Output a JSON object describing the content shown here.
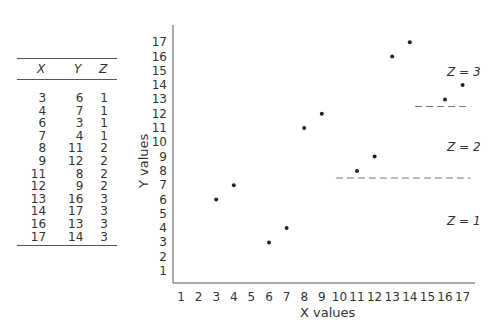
{
  "table": {
    "headers": [
      "X",
      "Y",
      "Z"
    ],
    "rows": [
      [
        "3",
        "6",
        "1"
      ],
      [
        "4",
        "7",
        "1"
      ],
      [
        "6",
        "3",
        "1"
      ],
      [
        "7",
        "4",
        "1"
      ],
      [
        "8",
        "11",
        "2"
      ],
      [
        "9",
        "12",
        "2"
      ],
      [
        "11",
        "8",
        "2"
      ],
      [
        "12",
        "9",
        "2"
      ],
      [
        "13",
        "16",
        "3"
      ],
      [
        "14",
        "17",
        "3"
      ],
      [
        "16",
        "13",
        "3"
      ],
      [
        "17",
        "14",
        "3"
      ]
    ]
  },
  "chart_data": {
    "type": "scatter",
    "title": "",
    "xlabel": "X values",
    "ylabel": "Y values",
    "xlim": [
      1,
      17
    ],
    "ylim": [
      1,
      17
    ],
    "x_ticks": [
      "1",
      "2",
      "3",
      "4",
      "5",
      "6",
      "7",
      "8",
      "9",
      "10",
      "11",
      "12",
      "13",
      "14",
      "15",
      "16",
      "17"
    ],
    "y_ticks": [
      "1",
      "2",
      "3",
      "4",
      "5",
      "6",
      "7",
      "8",
      "9",
      "10",
      "11",
      "12",
      "13",
      "14",
      "15",
      "16",
      "17"
    ],
    "grid": false,
    "series": [
      {
        "name": "Z = 1",
        "points": [
          {
            "x": 3,
            "y": 6
          },
          {
            "x": 4,
            "y": 7
          },
          {
            "x": 6,
            "y": 3
          },
          {
            "x": 7,
            "y": 4
          }
        ]
      },
      {
        "name": "Z = 2",
        "points": [
          {
            "x": 8,
            "y": 11
          },
          {
            "x": 9,
            "y": 12
          },
          {
            "x": 11,
            "y": 8
          },
          {
            "x": 12,
            "y": 9
          }
        ]
      },
      {
        "name": "Z = 3",
        "points": [
          {
            "x": 13,
            "y": 16
          },
          {
            "x": 14,
            "y": 17
          },
          {
            "x": 16,
            "y": 13
          },
          {
            "x": 17,
            "y": 14
          }
        ]
      }
    ],
    "annotations": [
      {
        "text": "Z = 3",
        "region": "upper right"
      },
      {
        "text": "Z = 2",
        "region": "middle right"
      },
      {
        "text": "Z = 1",
        "region": "lower right"
      }
    ],
    "boundaries": [
      {
        "type": "dashed",
        "y": 7.5,
        "x_from": 9.8,
        "x_to": 17
      },
      {
        "type": "dashed",
        "y": 12.5,
        "x_from": 14.3,
        "x_to": 17
      }
    ]
  },
  "labels": {
    "z3": "Z = 3",
    "z2": "Z = 2",
    "z1": "Z = 1",
    "xlabel": "X values",
    "ylabel": "Y values"
  }
}
